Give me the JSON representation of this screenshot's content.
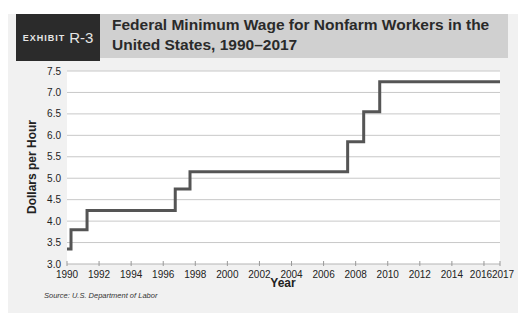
{
  "exhibit": {
    "label": "EXHIBIT",
    "number": "R-3"
  },
  "title": "Federal Minimum Wage for Nonfarm Workers in the United States, 1990–2017",
  "source": "Source: U.S. Department of Labor",
  "colors": {
    "line": "#555555",
    "grid": "#c8c8c8",
    "panel": "#f1f1f1",
    "title_band": "#d0d0d0",
    "exhibit_box": "#2b2b2b"
  },
  "chart_data": {
    "type": "line",
    "step": true,
    "title": "Federal Minimum Wage for Nonfarm Workers in the United States, 1990–2017",
    "xlabel": "Year",
    "ylabel": "Dollars per Hour",
    "xlim": [
      1990,
      2017
    ],
    "ylim": [
      3.0,
      7.5
    ],
    "grid": true,
    "x_ticks": [
      1990,
      1992,
      1994,
      1996,
      1998,
      2000,
      2002,
      2004,
      2006,
      2008,
      2010,
      2012,
      2014,
      2016,
      2017
    ],
    "y_ticks": [
      "3.0",
      "3.5",
      "4.0",
      "4.5",
      "5.0",
      "5.5",
      "6.0",
      "6.5",
      "7.0",
      "7.5"
    ],
    "series": [
      {
        "name": "Federal minimum wage",
        "x": [
          1990.0,
          1990.25,
          1991.25,
          1996.75,
          1997.67,
          2007.5,
          2008.5,
          2009.5,
          2017.0
        ],
        "values": [
          3.35,
          3.8,
          4.25,
          4.75,
          5.15,
          5.85,
          6.55,
          7.25,
          7.25
        ]
      }
    ]
  }
}
